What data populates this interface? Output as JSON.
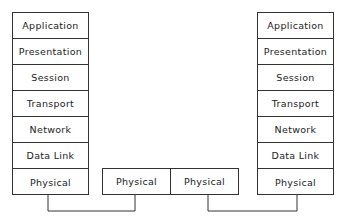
{
  "left_stack": {
    "layers": [
      "Application",
      "Presentation",
      "Session",
      "Transport",
      "Network",
      "Data Link",
      "Physical"
    ]
  },
  "middle": {
    "cells": [
      "Physical",
      "Physical"
    ]
  },
  "right_stack": {
    "layers": [
      "Application",
      "Presentation",
      "Session",
      "Transport",
      "Network",
      "Data Link",
      "Physical"
    ]
  }
}
